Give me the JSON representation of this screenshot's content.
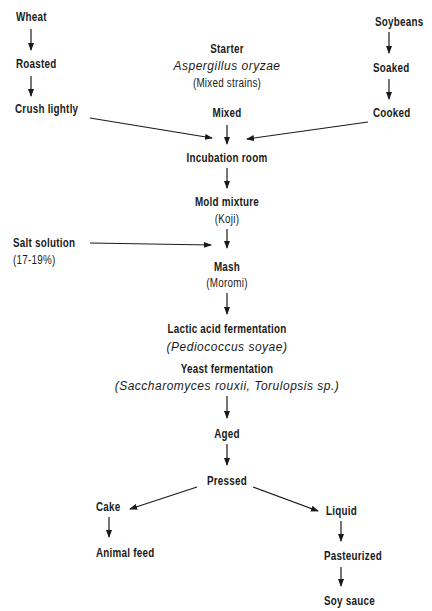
{
  "diagram": {
    "type": "flowchart",
    "nodes": {
      "wheat": "Wheat",
      "roasted": "Roasted",
      "crush": "Crush lightly",
      "soybeans": "Soybeans",
      "soaked": "Soaked",
      "cooked": "Cooked",
      "starter": "Starter",
      "starter_organism": "Aspergillus oryzae",
      "starter_note": "(Mixed strains)",
      "mixed": "Mixed",
      "incubation": "Incubation room",
      "mold": "Mold mixture",
      "mold_note": "(Koji)",
      "salt": "Salt solution",
      "salt_note": "(17-19%)",
      "mash": "Mash",
      "mash_note": "(Moromi)",
      "lactic": "Lactic acid fermentation",
      "lactic_organism": "(Pediococcus soyae)",
      "yeast": "Yeast fermentation",
      "yeast_organism": "(Saccharomyces rouxii, Torulopsis sp.)",
      "aged": "Aged",
      "pressed": "Pressed",
      "cake": "Cake",
      "feed": "Animal feed",
      "liquid": "Liquid",
      "pasteurized": "Pasteurized",
      "soysauce": "Soy sauce"
    },
    "edges": [
      [
        "Wheat",
        "Roasted"
      ],
      [
        "Roasted",
        "Crush lightly"
      ],
      [
        "Crush lightly",
        "Mixed"
      ],
      [
        "Soybeans",
        "Soaked"
      ],
      [
        "Soaked",
        "Cooked"
      ],
      [
        "Cooked",
        "Mixed"
      ],
      [
        "Starter",
        "Mixed"
      ],
      [
        "Mixed",
        "Incubation room"
      ],
      [
        "Incubation room",
        "Mold mixture"
      ],
      [
        "Mold mixture",
        "Mash"
      ],
      [
        "Salt solution",
        "Mash"
      ],
      [
        "Mash",
        "Lactic acid fermentation"
      ],
      [
        "Lactic acid fermentation",
        "Yeast fermentation"
      ],
      [
        "Yeast fermentation",
        "Aged"
      ],
      [
        "Aged",
        "Pressed"
      ],
      [
        "Pressed",
        "Cake"
      ],
      [
        "Pressed",
        "Liquid"
      ],
      [
        "Cake",
        "Animal feed"
      ],
      [
        "Liquid",
        "Pasteurized"
      ],
      [
        "Pasteurized",
        "Soy sauce"
      ]
    ]
  }
}
